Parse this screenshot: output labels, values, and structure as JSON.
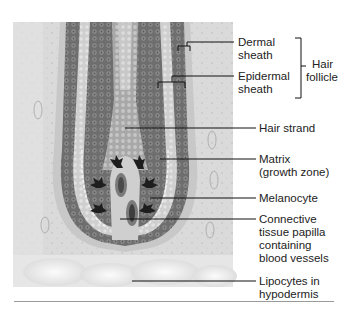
{
  "figure": {
    "colors": {
      "background": "#ffffff",
      "tissue_light": "#e6e6e6",
      "dermis": "#d4d4d4",
      "matrix_dark": "#6e6e6e",
      "matrix_cells": "#8a8a8a",
      "sheath_light": "#bdbdbd",
      "melanocyte": "#1e1e1e",
      "leader_line": "#111111",
      "divider": "#9a9a9a"
    }
  },
  "labels": {
    "dermal_sheath": [
      "Dermal",
      "sheath"
    ],
    "epidermal_sheath": [
      "Epidermal",
      "sheath"
    ],
    "hair_follicle": [
      "Hair",
      "follicle"
    ],
    "hair_strand": [
      "Hair strand"
    ],
    "matrix": [
      "Matrix",
      "(growth zone)"
    ],
    "melanocyte": [
      "Melanocyte"
    ],
    "papilla": [
      "Connective",
      "tissue papilla",
      "containing",
      "blood vessels"
    ],
    "lipocytes": [
      "Lipocytes in",
      "hypodermis"
    ]
  }
}
